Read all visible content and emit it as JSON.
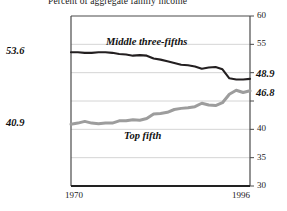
{
  "chart_data": {
    "type": "line",
    "title": "Percent of aggregate family income",
    "xlabel": "",
    "ylabel": "",
    "xlim": [
      1970,
      1996
    ],
    "ylim": [
      30,
      60
    ],
    "yticks": [
      30,
      35,
      40,
      45,
      50,
      55,
      60
    ],
    "ytick_labels": [
      "30",
      "35",
      "40",
      "45",
      "50",
      "55",
      "60"
    ],
    "xticks": [
      1970,
      1996
    ],
    "xtick_labels": [
      "1970",
      "1996"
    ],
    "grid": true,
    "legend_position": "inline-annotations",
    "series": [
      {
        "name": "Middle three-fifths",
        "color": "#231f20",
        "start_label": "53.6",
        "end_label": "48.9",
        "x": [
          1970,
          1971,
          1972,
          1973,
          1974,
          1975,
          1976,
          1977,
          1978,
          1979,
          1980,
          1981,
          1982,
          1983,
          1984,
          1985,
          1986,
          1987,
          1988,
          1989,
          1990,
          1991,
          1992,
          1993,
          1994,
          1995,
          1996
        ],
        "values": [
          53.6,
          53.6,
          53.5,
          53.5,
          53.6,
          53.6,
          53.5,
          53.3,
          53.2,
          53.0,
          53.1,
          53.0,
          52.5,
          52.3,
          52.0,
          51.7,
          51.4,
          51.3,
          51.1,
          50.7,
          50.9,
          51.0,
          50.6,
          49.0,
          48.8,
          48.8,
          48.9
        ]
      },
      {
        "name": "Top fifth",
        "color": "#9d9d9d",
        "start_label": "40.9",
        "end_label": "46.8",
        "x": [
          1970,
          1971,
          1972,
          1973,
          1974,
          1975,
          1976,
          1977,
          1978,
          1979,
          1980,
          1981,
          1982,
          1983,
          1984,
          1985,
          1986,
          1987,
          1988,
          1989,
          1990,
          1991,
          1992,
          1993,
          1994,
          1995,
          1996
        ],
        "values": [
          40.9,
          41.1,
          41.4,
          41.1,
          41.0,
          41.1,
          41.1,
          41.5,
          41.5,
          41.7,
          41.6,
          41.9,
          42.7,
          42.8,
          43.0,
          43.5,
          43.7,
          43.8,
          44.0,
          44.6,
          44.3,
          44.2,
          44.7,
          46.2,
          46.9,
          46.5,
          46.8
        ]
      }
    ]
  }
}
